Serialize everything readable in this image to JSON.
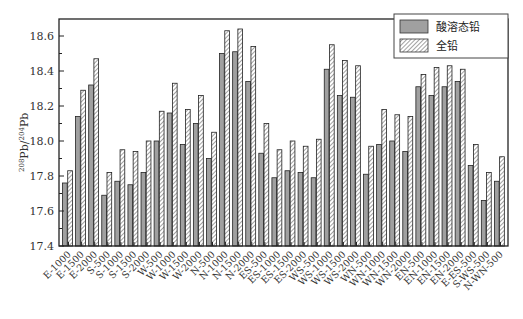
{
  "chart_data": {
    "type": "bar",
    "title": "",
    "xlabel": "",
    "ylabel": "208Pb/204Pb",
    "ylabel_parts": {
      "sup1": "208",
      "base1": "Pb/",
      "sup2": "204",
      "base2": "Pb"
    },
    "ylim": [
      17.4,
      18.7
    ],
    "yticks": [
      17.4,
      17.6,
      17.8,
      18.0,
      18.2,
      18.4,
      18.6
    ],
    "ytick_labels": [
      "17.4",
      "17.6",
      "17.8",
      "18.0",
      "18.2",
      "18.4",
      "18.6"
    ],
    "grid": false,
    "legend_position": "upper right",
    "categories": [
      "E-1000",
      "E-1500",
      "E-2000",
      "S-500",
      "S-1000",
      "S-1500",
      "S-2000",
      "W-500",
      "W-1000",
      "W-1500",
      "W-2000",
      "N-500",
      "N-1000",
      "N-1500",
      "N-2000",
      "ES-500",
      "ES-1000",
      "ES-1500",
      "ES-2000",
      "WS-500",
      "WS-1000",
      "WS-1500",
      "WS-2000",
      "WN-500",
      "WN-1000",
      "WN-1500",
      "WN-2000",
      "EN-500",
      "EN-1000",
      "EN-1500",
      "EN-2000",
      "E-ES-500",
      "S-WS-500",
      "N-WN-500"
    ],
    "series": [
      {
        "name": "酸溶态铅",
        "style": "solid-gray",
        "color": "#a0a0a0",
        "values": [
          17.76,
          18.14,
          18.32,
          17.69,
          17.77,
          17.75,
          17.82,
          18.0,
          18.16,
          17.98,
          18.1,
          17.9,
          18.5,
          18.51,
          18.34,
          17.93,
          17.79,
          17.83,
          17.82,
          17.79,
          18.41,
          18.26,
          18.25,
          17.81,
          17.98,
          18.0,
          17.94,
          18.31,
          18.26,
          18.31,
          18.34,
          17.86,
          17.66,
          17.77
        ]
      },
      {
        "name": "全铅",
        "style": "hatched",
        "color": "#ffffff",
        "values": [
          17.83,
          18.29,
          18.47,
          17.82,
          17.95,
          17.94,
          18.0,
          18.17,
          18.33,
          18.18,
          18.26,
          18.05,
          18.63,
          18.64,
          18.54,
          18.1,
          17.95,
          18.0,
          17.97,
          18.01,
          18.55,
          18.46,
          18.43,
          17.97,
          18.18,
          18.15,
          18.14,
          18.38,
          18.42,
          18.43,
          18.41,
          17.98,
          17.82,
          17.91
        ]
      }
    ]
  }
}
